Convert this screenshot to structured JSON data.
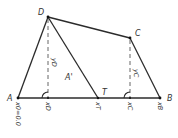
{
  "diagram": {
    "title": "",
    "points": {
      "A": {
        "label": "A"
      },
      "B": {
        "label": "B"
      },
      "C": {
        "label": "C"
      },
      "D": {
        "label": "D"
      },
      "T": {
        "label": "T"
      }
    },
    "region_label": "A'",
    "edges": [
      [
        "A",
        "D"
      ],
      [
        "D",
        "C"
      ],
      [
        "C",
        "B"
      ],
      [
        "B",
        "A"
      ],
      [
        "D",
        "T"
      ]
    ],
    "perpendiculars": [
      {
        "from": "D",
        "height_label": "yD",
        "foot_label": "xD"
      },
      {
        "from": "C",
        "height_label": "yC",
        "foot_label": "xC"
      }
    ],
    "axis_labels": {
      "A": "x0=0.0",
      "T": "xT",
      "B": "xB"
    },
    "colors": {
      "line": "#2b2b2b",
      "text": "#333333",
      "background": "#ffffff"
    }
  }
}
